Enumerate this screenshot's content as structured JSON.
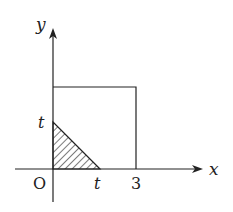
{
  "diagram": {
    "type": "coordinate-region",
    "axes": {
      "x_label": "x",
      "y_label": "y",
      "origin_label": "O"
    },
    "tick_labels": {
      "x_t": "t",
      "x_3": "3",
      "y_t": "t"
    },
    "shapes": {
      "square": {
        "x_from": 0,
        "x_to": 3,
        "y_from": 0,
        "y_to": 3
      },
      "shaded_triangle": {
        "vertices": [
          [
            0,
            0
          ],
          [
            "t",
            0
          ],
          [
            0,
            "t"
          ]
        ],
        "fill": "hatched"
      }
    },
    "colors": {
      "stroke": "#222222",
      "background": "#ffffff"
    }
  }
}
